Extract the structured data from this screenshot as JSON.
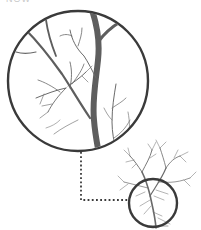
{
  "illustration": {
    "top_text_fragment": "NOW",
    "colors": {
      "background": "#ffffff",
      "outline": "#3a3a3a",
      "branch": "#5a5a5a",
      "twig": "#6e6e6e",
      "faint_twig": "#8a8a8a",
      "connector": "#3a3a3a"
    },
    "magnified_circle": {
      "cx": 78,
      "cy": 81,
      "r": 70
    },
    "small_circle": {
      "cx": 153,
      "cy": 203,
      "r": 24
    },
    "connector": {
      "points": "81,152 81,200 129,200"
    }
  }
}
